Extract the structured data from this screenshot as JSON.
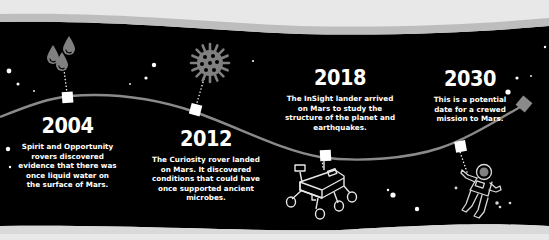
{
  "colors": {
    "background": "#000000",
    "paper": "#e8e8e8",
    "timeline": "#8a8a8a",
    "marker": "#ffffff",
    "icon_fill": "#808080",
    "text": "#ffffff"
  },
  "events": [
    {
      "year": "2004",
      "description_lines": [
        "Spirit and Opportunity",
        "rovers discovered",
        "evidence that there was",
        "once liquid water on",
        "the surface of Mars."
      ],
      "icon": "water-drops-icon"
    },
    {
      "year": "2012",
      "description_lines": [
        "The Curiosity rover landed",
        "on Mars. It discovered",
        "conditions that could have",
        "once supported ancient",
        "microbes."
      ],
      "icon": "microbe-icon"
    },
    {
      "year": "2018",
      "description_lines": [
        "The InSight lander arrived",
        "on Mars to study the",
        "structure of the planet and",
        "earthquakes."
      ],
      "icon": "rover-icon"
    },
    {
      "year": "2030",
      "description_lines": [
        "This is a potential",
        "date for a crewed",
        "mission to Mars."
      ],
      "icon": "astronaut-icon"
    }
  ]
}
